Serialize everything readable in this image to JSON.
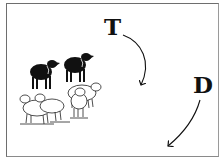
{
  "diagram": {
    "labels": [
      {
        "id": "T",
        "text": "T"
      },
      {
        "id": "D",
        "text": "D"
      }
    ],
    "arrows": [
      {
        "from": "T",
        "direction": "curving clockwise downward"
      },
      {
        "from": "D",
        "direction": "curving down-left"
      }
    ],
    "flock": {
      "black_sheep_count": 2,
      "white_sheep_count": 4
    },
    "colors": {
      "ink": "#111111",
      "background": "#ffffff",
      "frame": "#6e6e6e"
    }
  }
}
